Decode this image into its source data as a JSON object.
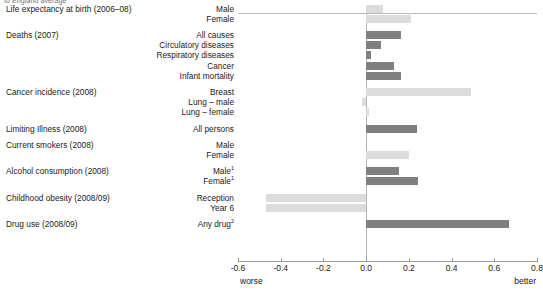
{
  "note": "to England average",
  "axis": {
    "ticks": [
      "-0.6",
      "-0.4",
      "-0.2",
      "0.0",
      "0.2",
      "0.4",
      "0.6",
      "0.8"
    ],
    "tick_values": [
      -0.6,
      -0.4,
      -0.2,
      0.0,
      0.2,
      0.4,
      0.6,
      0.8
    ],
    "worse_label": "worse",
    "better_label": "better"
  },
  "colors": {
    "dark_bar": "#808080",
    "light_bar": "#dcdcdc",
    "axis": "#9a9a9a",
    "text": "#1a1a1a"
  },
  "chart_data": {
    "type": "bar",
    "orientation": "horizontal",
    "title": "",
    "subtitle": "to England average",
    "xlabel": "",
    "ylabel": "",
    "xlim": [
      -0.6,
      0.8
    ],
    "grid": false,
    "legend": null,
    "axis_low_label": "worse",
    "axis_high_label": "better",
    "groups": [
      {
        "name": "Life expectancy at birth (2006–08)",
        "items": [
          {
            "label": "Male",
            "value": 0.08,
            "shade": "light"
          },
          {
            "label": "Female",
            "value": 0.21,
            "shade": "light"
          }
        ]
      },
      {
        "name": "Deaths (2007)",
        "items": [
          {
            "label": "All causes",
            "value": 0.165,
            "shade": "dark"
          },
          {
            "label": "Circulatory diseases",
            "value": 0.07,
            "shade": "dark"
          },
          {
            "label": "Respiratory diseases",
            "value": 0.025,
            "shade": "dark"
          },
          {
            "label": "Cancer",
            "value": 0.13,
            "shade": "dark"
          },
          {
            "label": "Infant mortality",
            "value": 0.165,
            "shade": "dark"
          }
        ]
      },
      {
        "name": "Cancer incidence (2008)",
        "items": [
          {
            "label": "Breast",
            "value": 0.49,
            "shade": "light"
          },
          {
            "label": "Lung – male",
            "value": -0.02,
            "shade": "light"
          },
          {
            "label": "Lung – female",
            "value": 0.012,
            "shade": "light"
          }
        ]
      },
      {
        "name": "Limiting Illness (2008)",
        "items": [
          {
            "label": "All persons",
            "value": 0.24,
            "shade": "dark"
          }
        ]
      },
      {
        "name": "Current smokers (2008)",
        "items": [
          {
            "label": "Male",
            "value": 0.0,
            "shade": "light"
          },
          {
            "label": "Female",
            "value": 0.2,
            "shade": "light"
          }
        ]
      },
      {
        "name": "Alcohol consumption (2008)",
        "items": [
          {
            "label": "Male",
            "footnote": "1",
            "value": 0.155,
            "shade": "dark"
          },
          {
            "label": "Female",
            "footnote": "1",
            "value": 0.245,
            "shade": "dark"
          }
        ]
      },
      {
        "name": "Childhood obesity (2008/09)",
        "items": [
          {
            "label": "Reception",
            "value": -0.47,
            "shade": "light"
          },
          {
            "label": "Year 6",
            "value": -0.47,
            "shade": "light"
          }
        ]
      },
      {
        "name": "Drug use (2008/09)",
        "items": [
          {
            "label": "Any drug",
            "footnote": "2",
            "value": 0.67,
            "shade": "dark"
          }
        ]
      }
    ]
  }
}
